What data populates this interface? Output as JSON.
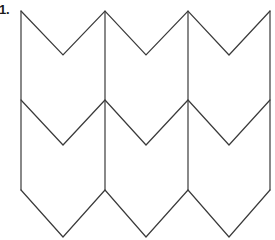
{
  "figure": {
    "label": "1.",
    "stroke_color": "#3a3a3a",
    "fill_color": "#ffffff",
    "background_color": "#ffffff",
    "stroke_width": 1.2
  },
  "chart_data": {
    "type": "line",
    "subtitle": "",
    "xlabel": "",
    "ylabel": "",
    "xlim": [
      0,
      275
    ],
    "ylim": [
      240,
      0
    ],
    "grid": false,
    "legend": "none",
    "annotations": [
      {
        "text": "1.",
        "x": 2,
        "y": 10
      }
    ],
    "geometry": {
      "peak_x": [
        21,
        105,
        188,
        270
      ],
      "valley_x": [
        63,
        146,
        229
      ],
      "row_peak_y": [
        11,
        100,
        190
      ],
      "row_valley_y": [
        55,
        145,
        237
      ],
      "period_x": 83.5,
      "row_spacing_y": 89,
      "chevron_depth_y": 44,
      "columns": 3,
      "rows": 3
    },
    "series": [
      {
        "name": "zigzag-row-top",
        "x": [
          21,
          63,
          105,
          146,
          188,
          229,
          270
        ],
        "y": [
          11,
          55,
          11,
          55,
          11,
          55,
          11
        ]
      },
      {
        "name": "zigzag-row-middle",
        "x": [
          21,
          63,
          105,
          146,
          188,
          229,
          270
        ],
        "y": [
          100,
          145,
          100,
          145,
          100,
          145,
          100
        ]
      },
      {
        "name": "zigzag-row-bottom",
        "x": [
          21,
          63,
          105,
          146,
          188,
          229,
          270
        ],
        "y": [
          190,
          237,
          190,
          237,
          190,
          237,
          190
        ]
      },
      {
        "name": "vertical-connector-1",
        "x": [
          21,
          21
        ],
        "y": [
          11,
          190
        ]
      },
      {
        "name": "vertical-connector-2",
        "x": [
          105,
          105
        ],
        "y": [
          11,
          190
        ]
      },
      {
        "name": "vertical-connector-3",
        "x": [
          188,
          188
        ],
        "y": [
          11,
          190
        ]
      },
      {
        "name": "vertical-connector-4",
        "x": [
          270,
          270
        ],
        "y": [
          11,
          190
        ]
      }
    ]
  }
}
